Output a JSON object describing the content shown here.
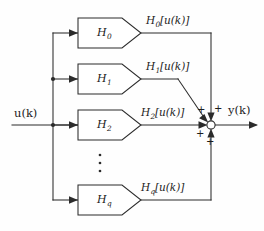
{
  "figure": {
    "kind": "block-diagram",
    "background_color": "#fefefe",
    "line_color": "#2b2b2b",
    "text_color": "#1c1c1c"
  },
  "io": {
    "input_label": "u(k)",
    "input_base": "u",
    "input_arg": "(k)",
    "output_label": "y(k)",
    "output_base": "y",
    "output_arg": "(k)"
  },
  "branches": [
    {
      "id": "branch-0",
      "block_base": "H",
      "block_subscript": "0",
      "block_label": "H0",
      "signal_base": "H",
      "signal_subscript": "0",
      "signal_arg": "[u(k)]",
      "signal_label": "H0[u(k)]"
    },
    {
      "id": "branch-1",
      "block_base": "H",
      "block_subscript": "1",
      "block_label": "H1",
      "signal_base": "H",
      "signal_subscript": "1",
      "signal_arg": "[u(k)]",
      "signal_label": "H1[u(k)]"
    },
    {
      "id": "branch-2",
      "block_base": "H",
      "block_subscript": "2",
      "block_label": "H2",
      "signal_base": "H",
      "signal_subscript": "2",
      "signal_arg": "[u(k)]",
      "signal_label": "H2[u(k)]"
    },
    {
      "id": "branch-q",
      "block_base": "H",
      "block_subscript": "q",
      "block_label": "Hq",
      "signal_base": "H",
      "signal_subscript": "q",
      "signal_arg": "[u(k)]",
      "signal_label": "Hq[u(k)]"
    }
  ],
  "continuation": {
    "symbol": "vertical-ellipsis",
    "dot_count": 3
  },
  "summing_junction": {
    "name": "summer",
    "shape": "open-circle",
    "sign_count": 4,
    "signs": [
      {
        "id": "sign-top-left",
        "text": "+"
      },
      {
        "id": "sign-top-right",
        "text": "+"
      },
      {
        "id": "sign-bottom-left",
        "text": "+"
      },
      {
        "id": "sign-bottom-right",
        "text": "+"
      }
    ]
  }
}
